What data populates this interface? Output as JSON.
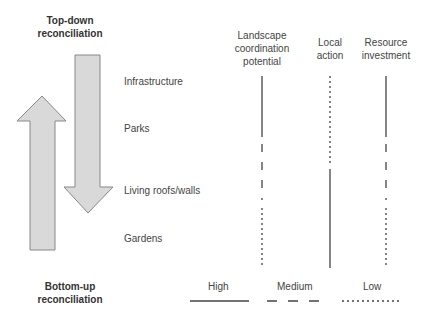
{
  "title_top": [
    "Top-down",
    "reconciliation"
  ],
  "title_bottom": [
    "Bottom-up",
    "reconciliation"
  ],
  "columns": [
    {
      "label": [
        "Landscape",
        "coordination",
        "potential"
      ],
      "x": 262
    },
    {
      "label": [
        "Local",
        "action"
      ],
      "x": 330
    },
    {
      "label": [
        "Resource",
        "investment"
      ],
      "x": 386
    }
  ],
  "rows": [
    "Infrastructure",
    "Parks",
    "Living roofs/walls",
    "Gardens"
  ],
  "legend": [
    {
      "label": "High",
      "style": "solid"
    },
    {
      "label": "Medium",
      "style": "dashed"
    },
    {
      "label": "Low",
      "style": "dotted"
    }
  ],
  "ratings": {
    "Landscape coordination potential": {
      "Infrastructure": "High",
      "Parks": "Medium",
      "Living roofs/walls": "Medium",
      "Gardens": "Low"
    },
    "Local action": {
      "Infrastructure": "Low",
      "Parks": "Low",
      "Living roofs/walls": "High",
      "Gardens": "High"
    },
    "Resource investment": {
      "Infrastructure": "High",
      "Parks": "Medium",
      "Living roofs/walls": "Medium",
      "Gardens": "Low"
    }
  },
  "colors": {
    "arrow_fill": "#d9d9d9",
    "arrow_stroke": "#888888",
    "line": "#444444"
  }
}
